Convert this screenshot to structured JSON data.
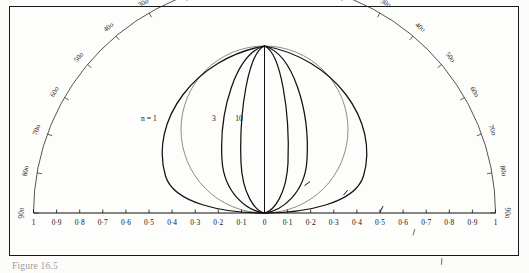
{
  "figure": {
    "caption": "Figure 16.5",
    "background_color": "#fcfcfa",
    "frame_color": "#171717",
    "ink_color": "#111111"
  },
  "chart_data": {
    "type": "line",
    "title": "",
    "subtitle": "",
    "xlabel": "",
    "ylabel": "",
    "grid": false,
    "legend_position": "inline-curve-labels",
    "apex": {
      "x": 0.0,
      "y": 1.0,
      "label": "0o"
    },
    "origin": {
      "x": 0.0,
      "y": 0.0
    },
    "xlim": [
      -1,
      1
    ],
    "ylim": [
      0,
      1
    ],
    "angular_axis": {
      "name": "angle-scale",
      "units": "degrees",
      "tick_interval": 10,
      "range": [
        0,
        90
      ],
      "mirrored": true,
      "left_ticks": [
        "90o",
        "80o",
        "70o",
        "60o",
        "50o",
        "40o",
        "30o",
        "20o",
        "10o"
      ],
      "apex_tick": "0o",
      "right_ticks": [
        "10o",
        "20o",
        "30o",
        "40o",
        "50o",
        "60o",
        "70o",
        "80o",
        "90o"
      ]
    },
    "linear_axis": {
      "name": "baseline-scale",
      "tick_interval": 0.1,
      "left_labels": [
        "1",
        "0·9",
        "0·8",
        "0·7",
        "0·6",
        "0·5",
        "0·4",
        "0·3",
        "0·2",
        "0·1"
      ],
      "center_label": "0",
      "right_labels": [
        "0·1",
        "0·2",
        "0·3",
        "0·4",
        "0·5",
        "0·6",
        "0·7",
        "0·8",
        "0·9",
        "1"
      ]
    },
    "series": [
      {
        "name": "n = 1",
        "label": "n = 1",
        "halfwidth": 0.5,
        "stroke_width": 1.25
      },
      {
        "name": "n = 3",
        "label": "3",
        "halfwidth": 0.2,
        "stroke_width": 1.25
      },
      {
        "name": "n = 10",
        "label": "10",
        "halfwidth": 0.115,
        "stroke_width": 1.25
      },
      {
        "name": "axis-curve",
        "label": "",
        "halfwidth": 0.0,
        "stroke_width": 1.0
      }
    ],
    "reference_circle": {
      "name": "unit-reference-circle",
      "center": [
        0.0,
        0.5
      ],
      "radius": 0.5,
      "stroke_width": 0.7
    },
    "outer_arc": {
      "name": "protractor-arc",
      "center": [
        0.0,
        0.0
      ],
      "radius": 1.0,
      "stroke_width": 0.8
    }
  },
  "labels": {
    "curve_n1": "n = 1",
    "curve_n3": "3",
    "curve_n10": "10"
  }
}
